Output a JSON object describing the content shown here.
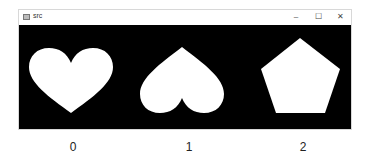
{
  "window": {
    "title": "src",
    "controls": {
      "minimize": "–",
      "maximize": "☐",
      "close": "✕"
    }
  },
  "canvas": {
    "background": "#000000",
    "shapes": [
      {
        "index": 0,
        "type": "heart",
        "orientation": "upright",
        "color": "#ffffff"
      },
      {
        "index": 1,
        "type": "heart",
        "orientation": "inverted",
        "color": "#ffffff"
      },
      {
        "index": 2,
        "type": "pentagon",
        "orientation": "upright",
        "color": "#ffffff"
      }
    ]
  },
  "labels": [
    "0",
    "1",
    "2"
  ]
}
